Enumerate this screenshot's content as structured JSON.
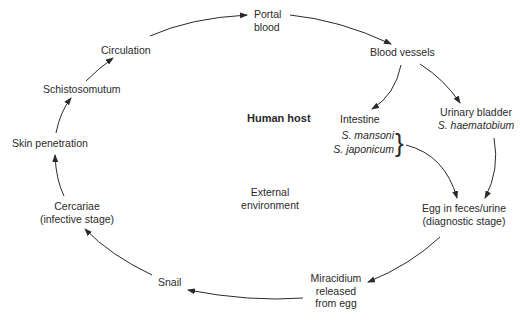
{
  "diagram": {
    "regions": {
      "human_host": "Human host",
      "external_environment": "External environment"
    },
    "nodes": {
      "portal_blood": "Portal blood",
      "blood_vessels": "Blood vessels",
      "intestine": "Intestine",
      "s_mansoni": "S. mansoni",
      "s_japonicum": "S. japonicum",
      "urinary_bladder": "Urinary bladder",
      "s_haematobium": "S. haematobium",
      "egg_line1": "Egg in feces/urine",
      "egg_line2": "(diagnostic stage)",
      "miracidium_line1": "Miracidium",
      "miracidium_line2": "released",
      "miracidium_line3": "from egg",
      "snail": "Snail",
      "cercariae_line1": "Cercariae",
      "cercariae_line2": "(infective stage)",
      "skin_penetration": "Skin penetration",
      "schistosomutum": "Schistosomutum",
      "circulation": "Circulation"
    },
    "edges": [
      [
        "Portal blood",
        "Blood vessels"
      ],
      [
        "Blood vessels",
        "Intestine"
      ],
      [
        "Blood vessels",
        "Urinary bladder"
      ],
      [
        "S. mansoni / S. japonicum",
        "Egg in feces/urine"
      ],
      [
        "S. haematobium",
        "Egg in feces/urine"
      ],
      [
        "Egg in feces/urine",
        "Miracidium released from egg"
      ],
      [
        "Miracidium released from egg",
        "Snail"
      ],
      [
        "Snail",
        "Cercariae"
      ],
      [
        "Cercariae",
        "Skin penetration"
      ],
      [
        "Skin penetration",
        "Schistosomutum"
      ],
      [
        "Schistosomutum",
        "Circulation"
      ],
      [
        "Circulation",
        "Portal blood"
      ]
    ],
    "colors": {
      "line": "#2a2a2a",
      "background": "#ffffff"
    }
  }
}
